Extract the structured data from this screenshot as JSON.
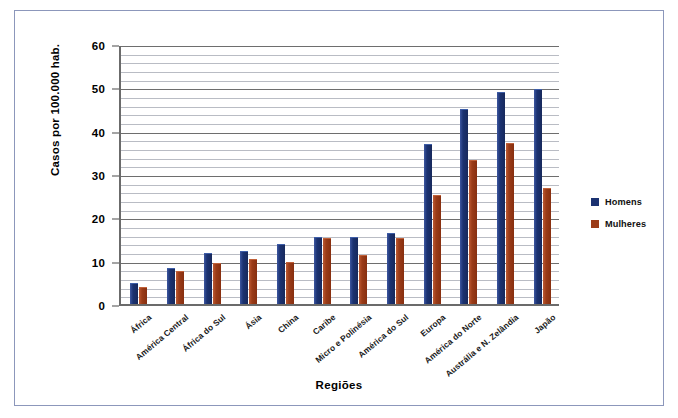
{
  "chart_data": {
    "type": "bar",
    "title": "",
    "xlabel": "Regiões",
    "ylabel": "Casos por 100.000 hab.",
    "ylim": [
      0,
      60
    ],
    "ytick_labels": [
      "0",
      "10",
      "20",
      "30",
      "40",
      "50",
      "60"
    ],
    "ytick_values": [
      0,
      10,
      20,
      30,
      40,
      50,
      60
    ],
    "grid": true,
    "grid_minor_step": 2,
    "legend_position": "right",
    "categories": [
      "África",
      "América Central",
      "África do Sul",
      "Ásia",
      "China",
      "Caribe",
      "Micro e Polinésia",
      "América do Sul",
      "Europa",
      "América do Norte",
      "Austrália e N. Zelândia",
      "Japão"
    ],
    "series": [
      {
        "name": "Homens",
        "color": "#1b3271",
        "values": [
          4.6,
          8.0,
          11.5,
          12.0,
          13.7,
          15.2,
          15.2,
          16.2,
          36.8,
          44.7,
          48.6,
          49.4
        ]
      },
      {
        "name": "Mulheres",
        "color": "#9b3c18",
        "values": [
          3.8,
          7.5,
          9.3,
          10.2,
          9.4,
          15.0,
          11.1,
          15.0,
          25.0,
          33.0,
          36.9,
          26.5
        ]
      }
    ]
  },
  "legend": {
    "items": [
      {
        "label": "Homens",
        "color": "#1b3271"
      },
      {
        "label": "Mulheres",
        "color": "#9b3c18"
      }
    ]
  }
}
